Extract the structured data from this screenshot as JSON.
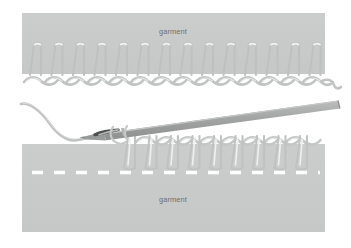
{
  "figure": {
    "background_color": "#ffffff",
    "width": 351,
    "height": 248
  },
  "palette": {
    "fabric_gray": "#c9cbcb",
    "fabric_gray_edge": "#bfc1c1",
    "thread_gray": "#bdbfbf",
    "thread_highlight": "#e3e5e5",
    "thread_shadow": "#aaacac",
    "needle_gray": "#a9abab",
    "needle_dark": "#6f7171",
    "needle_eye_dark": "#4a4c4c",
    "dash_white": "#fdfdfd",
    "label_text": "#6e6e6e",
    "background": "#ffffff"
  },
  "panels": {
    "upper": {
      "name": "upper garment panel",
      "label": "garment",
      "x": 22,
      "y": 13,
      "width": 303,
      "height": 61
    },
    "lower": {
      "name": "lower garment panel",
      "label": "garment",
      "x": 22,
      "y": 144,
      "width": 303,
      "height": 88
    }
  },
  "upper_diagram": {
    "name": "completed blanket stitch row",
    "stitch_count": 13,
    "stitch_start_x": 32,
    "stitch_spacing": 21.5,
    "stitch_top_y": 43,
    "stitch_bottom_y": 76,
    "chain_y": 80,
    "chain_link_count": 13,
    "has_trailing_thread_tail": true,
    "tail_end_x": 338
  },
  "lower_diagram": {
    "name": "blanket stitch in progress with needle",
    "stitch_count": 9,
    "stitch_start_x": 127,
    "stitch_spacing": 21.5,
    "stitch_top_y": 135,
    "stitch_bottom_y": 168,
    "chain_y": 140,
    "dashed_guideline": {
      "name": "stitch placement guideline",
      "y": 172,
      "x_start": 32,
      "x_end": 320,
      "dash_length": 11,
      "gap_length": 11,
      "color": "#fdfdfd"
    }
  },
  "needle": {
    "name": "sewing needle",
    "tip_x": 85,
    "tip_y": 137,
    "tail_x": 340,
    "tail_y": 104,
    "shaft_width": 6.5,
    "eye_center_x": 107,
    "eye_center_y": 131,
    "has_eye": true
  },
  "thread_tail": {
    "name": "loose thread tail entering needle eye",
    "start_x": 21,
    "start_y": 104,
    "end_x": 103,
    "end_y": 133
  },
  "labels": [
    {
      "id": "upper-garment-label",
      "text": "garment",
      "x": 173,
      "y": 34
    },
    {
      "id": "lower-garment-label",
      "text": "garment",
      "x": 173,
      "y": 202
    }
  ]
}
